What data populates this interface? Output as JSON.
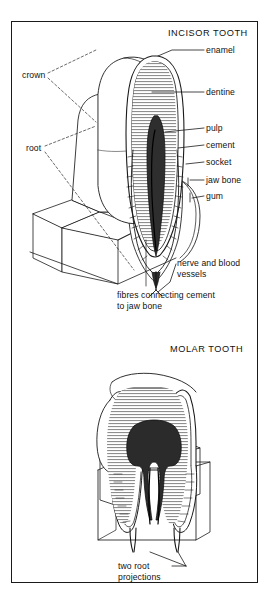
{
  "figure": {
    "kind": "anatomical-diagram",
    "frame_color": "#1a1a1a",
    "background": "#ffffff",
    "ink": "#111111"
  },
  "panels": {
    "incisor": {
      "title": "INCISOR TOOTH",
      "left_labels": [
        {
          "id": "crown",
          "text": "crown",
          "x": 22,
          "y": 75
        },
        {
          "id": "root",
          "text": "root",
          "x": 26,
          "y": 148
        }
      ],
      "right_labels": [
        {
          "id": "enamel",
          "text": "enamel",
          "x": 206,
          "y": 58
        },
        {
          "id": "dentine",
          "text": "dentine",
          "x": 206,
          "y": 92
        },
        {
          "id": "pulp",
          "text": "pulp",
          "x": 206,
          "y": 131
        },
        {
          "id": "cement",
          "text": "cement",
          "x": 206,
          "y": 147
        },
        {
          "id": "socket",
          "text": "socket",
          "x": 206,
          "y": 164
        },
        {
          "id": "jaw-bone",
          "text": "jaw bone",
          "x": 206,
          "y": 181
        },
        {
          "id": "gum",
          "text": "gum",
          "x": 206,
          "y": 198
        }
      ],
      "bottom_labels": [
        {
          "id": "nerve-and-blood-vessels",
          "line1": "nerve and blood",
          "line2": "vessels",
          "x": 177,
          "y": 262
        },
        {
          "id": "fibres-connecting-cement-to-jaw-bone",
          "line1": "fibres connecting cement",
          "line2": "to jaw bone",
          "x": 117,
          "y": 291
        }
      ]
    },
    "molar": {
      "title": "MOLAR TOOTH",
      "bottom_labels": [
        {
          "id": "two-root-projections",
          "line1": "two root",
          "line2": "projections",
          "x": 133,
          "y": 563
        }
      ]
    }
  }
}
